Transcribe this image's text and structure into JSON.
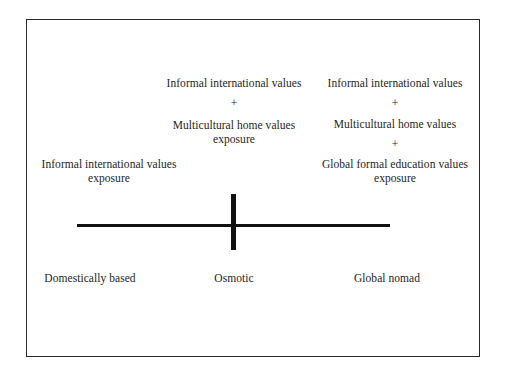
{
  "diagram": {
    "type": "continuum",
    "axis": {
      "orientation": "horizontal",
      "marker": "center-vertical-tick"
    },
    "positions": [
      {
        "label": "Domestically based",
        "description_lines": [
          "Informal international values",
          "exposure"
        ]
      },
      {
        "label": "Osmotic",
        "description_lines": [
          "Informal international values",
          "+",
          "Multicultural home values",
          "exposure"
        ]
      },
      {
        "label": "Global nomad",
        "description_lines": [
          "Informal international values",
          "+",
          "Multicultural home values",
          "+",
          "Global formal education values",
          "exposure"
        ]
      }
    ]
  }
}
